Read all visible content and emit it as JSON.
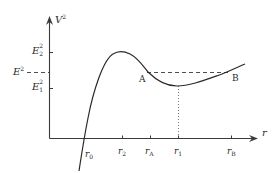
{
  "diagram": {
    "type": "effective-potential-curve",
    "y_axis": {
      "label_base": "V",
      "label_sup": "2"
    },
    "x_axis": {
      "label": "r"
    },
    "y_levels": [
      {
        "id": "E2sq",
        "base": "E",
        "sup": "2",
        "sub": "2"
      },
      {
        "id": "Esq",
        "base": "E",
        "sup": "2"
      },
      {
        "id": "E1sq",
        "base": "E",
        "sup": "2",
        "sub": "1"
      }
    ],
    "x_ticks": [
      {
        "id": "r0",
        "base": "r",
        "sub": "0"
      },
      {
        "id": "r2",
        "base": "r",
        "sub": "2"
      },
      {
        "id": "rA",
        "base": "r",
        "sub": "A"
      },
      {
        "id": "r1",
        "base": "r",
        "sub": "1"
      },
      {
        "id": "rB",
        "base": "r",
        "sub": "B"
      }
    ],
    "points": [
      {
        "id": "A",
        "label": "A"
      },
      {
        "id": "B",
        "label": "B"
      }
    ],
    "colors": {
      "line": "#2a2a2a",
      "dashed": "#3a3a3a",
      "dotted": "#6a6a6a",
      "background": "#ffffff"
    }
  }
}
